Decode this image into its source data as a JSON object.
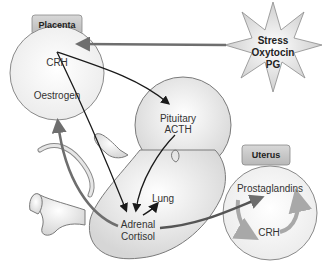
{
  "placenta": {
    "title": "Placenta",
    "items": [
      "CRH",
      "Oestrogen"
    ]
  },
  "stimuli": {
    "lines": [
      "Stress",
      "Oxytocin",
      "PG"
    ]
  },
  "fetus": {
    "pituitary": [
      "Pituitary",
      "ACTH"
    ],
    "lung": "Lung",
    "adrenal": [
      "Adrenal",
      "Cortisol"
    ]
  },
  "uterus": {
    "title": "Uterus",
    "items": [
      "Prostaglandins",
      "CRH"
    ]
  },
  "colors": {
    "black_arrow": "#1a1a1a",
    "gray_arrow": "#6e6e6e",
    "circle_fill": "#f4f4f4",
    "tab_fill": "#c8c8c8",
    "uterus_cycle": "#a8a8a8"
  }
}
